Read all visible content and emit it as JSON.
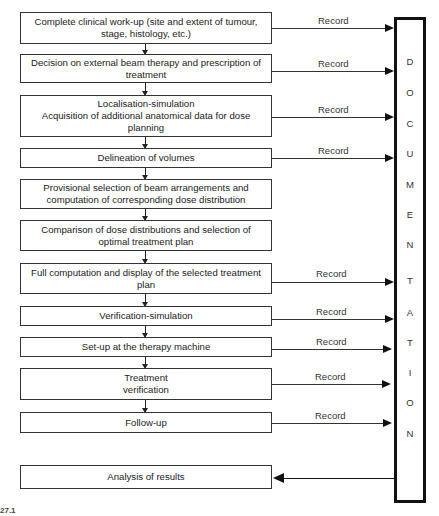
{
  "diagram": {
    "steps": [
      {
        "label": "Complete clinical work-up (site and extent of tumour, stage, histology, etc.)",
        "record": "Record"
      },
      {
        "label": "Decision on external beam therapy and prescription of treatment",
        "record": "Record"
      },
      {
        "label": "Localisation-simulation\nAcquisition of additional anatomical data for dose planning",
        "record": "Record"
      },
      {
        "label": "Delineation of volumes",
        "record": "Record"
      },
      {
        "label": "Provisional selection of beam arrangements and computation of corresponding dose distribution",
        "record": ""
      },
      {
        "label": "Comparison of dose distributions and selection of optimal treatment plan",
        "record": ""
      },
      {
        "label": "Full computation and display of the selected treatment plan",
        "record": "Record"
      },
      {
        "label": "Verification-simulation",
        "record": "Record"
      },
      {
        "label": "Set-up at the therapy machine",
        "record": "Record"
      },
      {
        "label": "Treatment\nverification",
        "record": "Record"
      },
      {
        "label": "Follow-up",
        "record": "Record"
      }
    ],
    "final_step": "Analysis of results",
    "documentation_letters": [
      "D",
      "O",
      "C",
      "U",
      "M",
      "E",
      "N",
      "T",
      "A",
      "T",
      "I",
      "O",
      "N"
    ],
    "caption_fragment": "27.1"
  }
}
